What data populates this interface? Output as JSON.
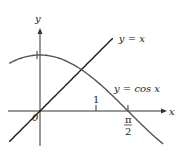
{
  "chart_data": {
    "type": "line",
    "title": "",
    "xlabel": "x",
    "ylabel": "y",
    "xlim": [
      -0.55,
      2.2
    ],
    "ylim": [
      -0.6,
      1.45
    ],
    "origin_label": "0",
    "x_ticks": [
      {
        "value": 1,
        "label": "1"
      },
      {
        "value": 1.5708,
        "label_num": "π",
        "label_den": "2"
      }
    ],
    "y_ticks": [
      {
        "value": 1,
        "label": ""
      }
    ],
    "series": [
      {
        "name": "y = x",
        "function": "x",
        "x_range": [
          -0.55,
          1.3
        ],
        "color": "#1a1a1a"
      },
      {
        "name": "y = cos x",
        "function": "cos",
        "x_range": [
          -0.55,
          2.2
        ],
        "color": "#555555"
      }
    ],
    "annotations": [
      {
        "text": "y = x",
        "for_series": 0
      },
      {
        "text": "y = cos x",
        "for_series": 1
      }
    ],
    "grid": false,
    "legend": "none"
  }
}
